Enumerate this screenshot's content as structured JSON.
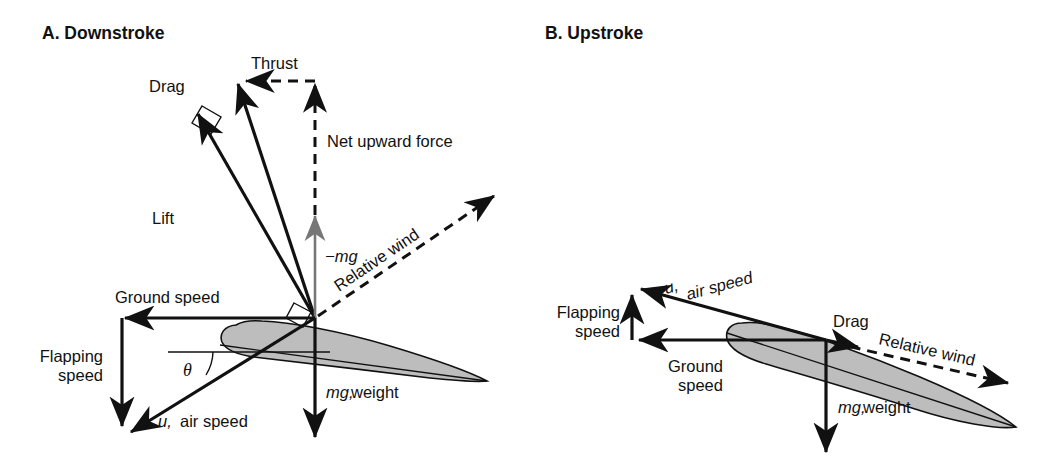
{
  "figure": {
    "title_a": "A. Downstroke",
    "title_b": "B. Upstroke",
    "background": "#ffffff",
    "ink": "#111111",
    "airfoil_fill": "#bdbdbd",
    "gray_vector": "#777777"
  },
  "panel_a": {
    "label": "A. Downstroke",
    "labels": {
      "drag": "Drag",
      "thrust": "Thrust",
      "lift": "Lift",
      "net_upward_force": "Net upward force",
      "neg_mg": "−mg",
      "relative_wind": "Relative wind",
      "ground_speed": "Ground speed",
      "flapping_speed_line1": "Flapping",
      "flapping_speed_line2": "speed",
      "theta": "θ",
      "air_speed_symbol": "u,",
      "air_speed_text": "air speed",
      "weight_symbol": "mg,",
      "weight_text": "weight"
    },
    "vectors": [
      {
        "name": "drag",
        "from": [
          315,
          318
        ],
        "to": [
          196,
          110
        ],
        "style": "solid"
      },
      {
        "name": "lift",
        "from": [
          315,
          318
        ],
        "to": [
          237,
          80
        ],
        "style": "solid"
      },
      {
        "name": "thrust",
        "from": [
          315,
          81
        ],
        "to": [
          243,
          81
        ],
        "style": "dashed"
      },
      {
        "name": "net-upward-force",
        "from": [
          315,
          215
        ],
        "to": [
          315,
          81
        ],
        "style": "dashed"
      },
      {
        "name": "neg-mg",
        "from": [
          315,
          318
        ],
        "to": [
          315,
          213
        ],
        "style": "gray-solid"
      },
      {
        "name": "relative-wind",
        "from": [
          315,
          318
        ],
        "to": [
          497,
          194
        ],
        "style": "dashed"
      },
      {
        "name": "ground-speed",
        "from": [
          315,
          318
        ],
        "to": [
          122,
          318
        ],
        "style": "solid"
      },
      {
        "name": "flapping-speed",
        "from": [
          122,
          318
        ],
        "to": [
          122,
          429
        ],
        "style": "solid"
      },
      {
        "name": "air-speed-u",
        "from": [
          315,
          318
        ],
        "to": [
          128,
          434
        ],
        "style": "solid"
      },
      {
        "name": "mg-weight",
        "from": [
          315,
          318
        ],
        "to": [
          315,
          440
        ],
        "style": "solid"
      }
    ],
    "right_angle_marks": [
      "drag-lift-corner",
      "chord-relative-wind-corner"
    ]
  },
  "panel_b": {
    "label": "B. Upstroke",
    "labels": {
      "flapping_speed_line1": "Flapping",
      "flapping_speed_line2": "speed",
      "air_speed_symbol": "u,",
      "air_speed_text": "air speed",
      "ground_speed_line1": "Ground",
      "ground_speed_line2": "speed",
      "drag": "Drag",
      "relative_wind": "Relative wind",
      "weight_symbol": "mg,",
      "weight_text": "weight"
    },
    "vectors": [
      {
        "name": "ground-speed",
        "from": [
          826,
          340
        ],
        "to": [
          636,
          340
        ],
        "style": "solid"
      },
      {
        "name": "flapping-speed",
        "from": [
          632,
          340
        ],
        "to": [
          632,
          292
        ],
        "style": "solid"
      },
      {
        "name": "air-speed-u",
        "from": [
          826,
          340
        ],
        "to": [
          638,
          288
        ],
        "style": "solid"
      },
      {
        "name": "drag",
        "from": [
          826,
          340
        ],
        "to": [
          862,
          348
        ],
        "style": "solid"
      },
      {
        "name": "relative-wind",
        "from": [
          832,
          342
        ],
        "to": [
          1012,
          384
        ],
        "style": "dashed"
      },
      {
        "name": "mg-weight",
        "from": [
          826,
          340
        ],
        "to": [
          826,
          455
        ],
        "style": "solid"
      }
    ]
  }
}
